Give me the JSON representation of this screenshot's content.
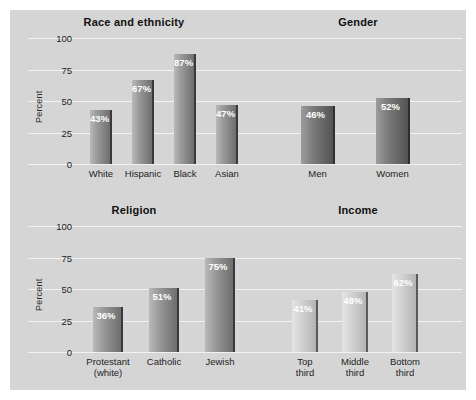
{
  "chart_data": [
    {
      "type": "bar",
      "title": "Race and ethnicity",
      "xlabel": "",
      "ylabel": "Percent",
      "ylim": [
        0,
        100
      ],
      "yticks": [
        0,
        25,
        50,
        75,
        100
      ],
      "grid": true,
      "legend": "none",
      "categories": [
        "White",
        "Hispanic",
        "Black",
        "Asian"
      ],
      "values": [
        43,
        67,
        87,
        47
      ],
      "value_labels": [
        "43%",
        "67%",
        "87%",
        "47%"
      ],
      "bar_style": "medium"
    },
    {
      "type": "bar",
      "title": "Gender",
      "xlabel": "",
      "ylabel": "",
      "ylim": [
        0,
        100
      ],
      "yticks": [
        0,
        25,
        50,
        75,
        100
      ],
      "grid": true,
      "legend": "none",
      "categories": [
        "Men",
        "Women"
      ],
      "values": [
        46,
        52
      ],
      "value_labels": [
        "46%",
        "52%"
      ],
      "bar_style": "dark"
    },
    {
      "type": "bar",
      "title": "Religion",
      "xlabel": "",
      "ylabel": "Percent",
      "ylim": [
        0,
        100
      ],
      "yticks": [
        0,
        25,
        50,
        75,
        100
      ],
      "grid": true,
      "legend": "none",
      "categories": [
        "Protestant (white)",
        "Catholic",
        "Jewish"
      ],
      "category_lines": [
        [
          "Protestant",
          "(white)"
        ],
        [
          "Catholic"
        ],
        [
          "Jewish"
        ]
      ],
      "values": [
        36,
        51,
        75
      ],
      "value_labels": [
        "36%",
        "51%",
        "75%"
      ],
      "bar_style": "medium"
    },
    {
      "type": "bar",
      "title": "Income",
      "xlabel": "",
      "ylabel": "",
      "ylim": [
        0,
        100
      ],
      "yticks": [
        0,
        25,
        50,
        75,
        100
      ],
      "grid": true,
      "legend": "none",
      "categories": [
        "Top third",
        "Middle third",
        "Bottom third"
      ],
      "category_lines": [
        [
          "Top",
          "third"
        ],
        [
          "Middle",
          "third"
        ],
        [
          "Bottom",
          "third"
        ]
      ],
      "values": [
        41,
        48,
        62
      ],
      "value_labels": [
        "41%",
        "48%",
        "62%"
      ],
      "bar_style": "light"
    }
  ],
  "yticks": {
    "t0": "0",
    "t25": "25",
    "t50": "50",
    "t75": "75",
    "t100": "100"
  },
  "colors": {
    "page_background": "#ffffff",
    "panel_background": "#d5d5d5",
    "gridline": "#f2f2f2",
    "title_text": "#111111",
    "tick_text": "#1d1d1d",
    "value_text": "#ffffff",
    "bar_medium_light": "#b9b9b9",
    "bar_medium_dark": "#6e6e6e",
    "bar_dark_light": "#9d9d9d",
    "bar_dark_dark": "#535353",
    "bar_light_light": "#e4e4e4",
    "bar_light_dark": "#b4b4b4"
  }
}
